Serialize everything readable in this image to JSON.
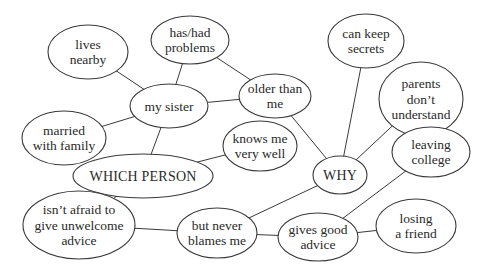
{
  "diagram": {
    "type": "mind-map",
    "colors": {
      "stroke": "#3a3a3a",
      "text": "#2a2a2a",
      "background": "#ffffff"
    },
    "nodes": [
      {
        "id": "which_person",
        "lines": [
          "WHICH PERSON"
        ],
        "cx": 143,
        "cy": 176,
        "rx": 70,
        "ry": 22,
        "big": true
      },
      {
        "id": "why",
        "lines": [
          "WHY"
        ],
        "cx": 340,
        "cy": 175,
        "rx": 27,
        "ry": 19,
        "big": true
      },
      {
        "id": "my_sister",
        "lines": [
          "my sister"
        ],
        "cx": 169,
        "cy": 106,
        "rx": 39,
        "ry": 22
      },
      {
        "id": "lives_nearby",
        "lines": [
          "lives",
          "nearby"
        ],
        "cx": 88,
        "cy": 52,
        "rx": 40,
        "ry": 27
      },
      {
        "id": "has_had_problems",
        "lines": [
          "has/had",
          "problems"
        ],
        "cx": 190,
        "cy": 40,
        "rx": 39,
        "ry": 24
      },
      {
        "id": "older_than_me",
        "lines": [
          "older than",
          "me"
        ],
        "cx": 275,
        "cy": 96,
        "rx": 36,
        "ry": 22
      },
      {
        "id": "married_with_family",
        "lines": [
          "married",
          "with family"
        ],
        "cx": 64,
        "cy": 138,
        "rx": 42,
        "ry": 27
      },
      {
        "id": "knows_me_very_well",
        "lines": [
          "knows me",
          "very well"
        ],
        "cx": 260,
        "cy": 146,
        "rx": 37,
        "ry": 25
      },
      {
        "id": "isnt_afraid",
        "lines": [
          "isn’t afraid to",
          "give unwelcome",
          "advice"
        ],
        "cx": 79,
        "cy": 225,
        "rx": 56,
        "ry": 34
      },
      {
        "id": "but_never_blames_me",
        "lines": [
          "but never",
          "blames me"
        ],
        "cx": 217,
        "cy": 233,
        "rx": 40,
        "ry": 25
      },
      {
        "id": "gives_good_advice",
        "lines": [
          "gives good",
          "advice"
        ],
        "cx": 318,
        "cy": 237,
        "rx": 40,
        "ry": 24
      },
      {
        "id": "can_keep_secrets",
        "lines": [
          "can keep",
          "secrets"
        ],
        "cx": 366,
        "cy": 41,
        "rx": 38,
        "ry": 27
      },
      {
        "id": "parents_dont_understand",
        "lines": [
          "parents",
          "don’t",
          "understand"
        ],
        "cx": 421,
        "cy": 99,
        "rx": 42,
        "ry": 37
      },
      {
        "id": "leaving_college",
        "lines": [
          "leaving",
          "college"
        ],
        "cx": 431,
        "cy": 152,
        "rx": 39,
        "ry": 25
      },
      {
        "id": "losing_a_friend",
        "lines": [
          "losing",
          "a friend"
        ],
        "cx": 416,
        "cy": 226,
        "rx": 40,
        "ry": 27
      }
    ],
    "edges": [
      [
        "my_sister",
        "lives_nearby"
      ],
      [
        "my_sister",
        "has_had_problems"
      ],
      [
        "my_sister",
        "older_than_me"
      ],
      [
        "my_sister",
        "married_with_family"
      ],
      [
        "my_sister",
        "which_person"
      ],
      [
        "has_had_problems",
        "older_than_me"
      ],
      [
        "older_than_me",
        "why"
      ],
      [
        "which_person",
        "knows_me_very_well"
      ],
      [
        "which_person",
        "isnt_afraid"
      ],
      [
        "isnt_afraid",
        "but_never_blames_me"
      ],
      [
        "but_never_blames_me",
        "why"
      ],
      [
        "but_never_blames_me",
        "gives_good_advice"
      ],
      [
        "why",
        "can_keep_secrets"
      ],
      [
        "why",
        "parents_dont_understand"
      ],
      [
        "gives_good_advice",
        "leaving_college"
      ],
      [
        "gives_good_advice",
        "losing_a_friend"
      ]
    ]
  }
}
